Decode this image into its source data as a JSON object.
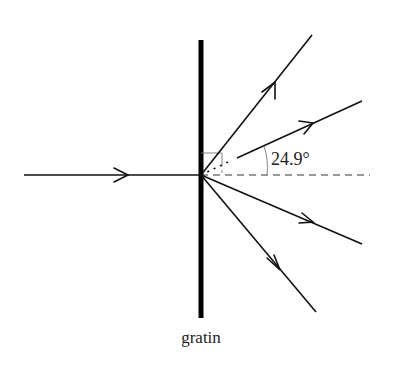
{
  "diagram": {
    "labels": {
      "grating": "gratin",
      "angle": "24.9°"
    },
    "grating": {
      "x": 201,
      "y_top": 40,
      "y_bottom": 318,
      "width": 5
    },
    "incident_ray": {
      "from": [
        24,
        175
      ],
      "to": [
        201,
        175
      ],
      "arrow_at": [
        128,
        175
      ]
    },
    "origin": [
      201,
      175
    ],
    "diffracted_rays": [
      {
        "order": "upper-2",
        "end": [
          312,
          35
        ]
      },
      {
        "order": "upper-1",
        "end": [
          362,
          101
        ],
        "angle_deg": 24.9
      },
      {
        "order": "lower-1",
        "end": [
          362,
          244
        ]
      },
      {
        "order": "lower-2",
        "end": [
          316,
          312
        ]
      }
    ],
    "normal_line": {
      "from": [
        201,
        175
      ],
      "to": [
        370,
        175
      ],
      "style": "dashed"
    },
    "colors": {
      "line": "#111111",
      "grating": "#000000",
      "text": "#222222"
    }
  }
}
